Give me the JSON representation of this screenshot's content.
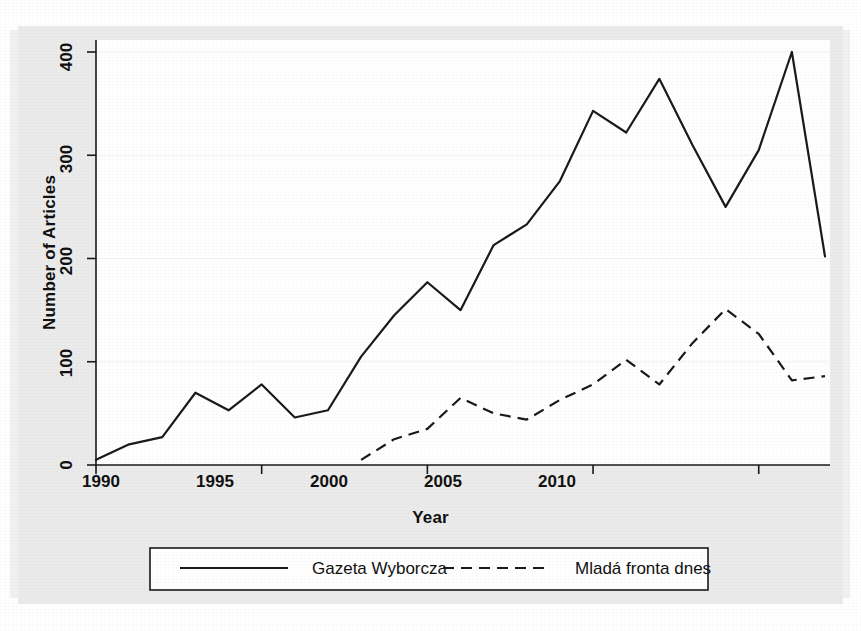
{
  "chart_data": {
    "type": "line",
    "title": "",
    "xlabel": "Year",
    "ylabel": "Number of Articles",
    "xlim": [
      1990,
      2012
    ],
    "ylim": [
      0,
      400
    ],
    "xticks": [
      1990,
      1995,
      2000,
      2005,
      2010
    ],
    "yticks": [
      0,
      100,
      200,
      300,
      400
    ],
    "grid": "horizontal-faint",
    "legend_position": "below-axes",
    "x": [
      1990,
      1991,
      1992,
      1993,
      1994,
      1995,
      1996,
      1997,
      1998,
      1999,
      2000,
      2001,
      2002,
      2003,
      2004,
      2005,
      2006,
      2007,
      2008,
      2009,
      2010,
      2011,
      2012
    ],
    "series": [
      {
        "name": "Gazeta Wyborcza",
        "style": "solid",
        "color": "#1a1a1a",
        "x": [
          1990,
          1991,
          1992,
          1993,
          1994,
          1995,
          1996,
          1997,
          1998,
          1999,
          2000,
          2001,
          2002,
          2003,
          2004,
          2005,
          2006,
          2007,
          2008,
          2009,
          2010,
          2011,
          2012
        ],
        "values": [
          5,
          20,
          27,
          70,
          53,
          78,
          46,
          53,
          105,
          145,
          177,
          150,
          213,
          233,
          275,
          343,
          322,
          374,
          310,
          250,
          305,
          400,
          202
        ]
      },
      {
        "name": "Mladá fronta dnes",
        "style": "dashed",
        "color": "#1a1a1a",
        "x": [
          1998,
          1999,
          2000,
          2001,
          2002,
          2003,
          2004,
          2005,
          2006,
          2007,
          2008,
          2009,
          2010,
          2011,
          2012
        ],
        "values": [
          5,
          25,
          35,
          65,
          50,
          44,
          63,
          78,
          102,
          78,
          118,
          151,
          127,
          82,
          86
        ]
      }
    ]
  },
  "axes": {
    "x_label": "Year",
    "y_label": "Number of Articles",
    "x_tick_labels": [
      "1990",
      "1995",
      "2000",
      "2005",
      "2010"
    ],
    "y_tick_labels": [
      "0",
      "100",
      "200",
      "300",
      "400"
    ]
  },
  "legend": {
    "items": [
      {
        "label": "Gazeta Wyborcza",
        "style": "solid"
      },
      {
        "label": "Mladá fronta dnes",
        "style": "dashed"
      }
    ]
  },
  "colors": {
    "line": "#1a1a1a",
    "plot_background": "#ffffff",
    "page_background": "#ebebeb",
    "grid": "#f2f2f2"
  }
}
